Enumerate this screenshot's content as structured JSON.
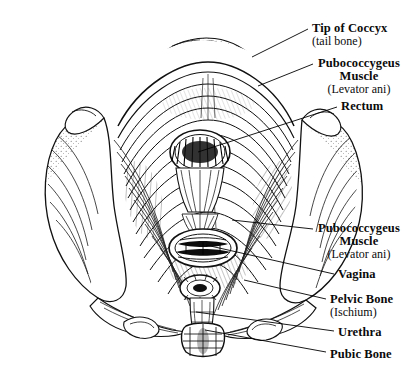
{
  "figure": {
    "style": "pen-and-ink engraving, black line art on white",
    "background_color": "#ffffff",
    "ink_color": "#000000"
  },
  "labels": [
    {
      "id": "tip-of-coccyx",
      "primary": "Tip of Coccyx",
      "secondary": "(tail bone)",
      "align": "left",
      "text_x": 312,
      "text_y": 22,
      "leader": {
        "x1": 308,
        "y1": 29,
        "x2": 252,
        "y2": 57
      }
    },
    {
      "id": "pubococcygeus-muscle-upper",
      "primary": "Pubococcygeus",
      "primary2": "Muscle",
      "secondary": "(Levator ani)",
      "align": "center",
      "text_x": 318,
      "text_y": 57,
      "leader": {
        "x1": 313,
        "y1": 64,
        "x2": 258,
        "y2": 86
      }
    },
    {
      "id": "rectum",
      "primary": "Rectum",
      "align": "left",
      "text_x": 341,
      "text_y": 100,
      "leader": {
        "x1": 337,
        "y1": 107,
        "x2": 198,
        "y2": 152
      }
    },
    {
      "id": "pubococcygeus-muscle-lower",
      "primary": "Pubococcygeus",
      "primary2": "Muscle",
      "secondary": "(Levator ani)",
      "align": "center",
      "text_x": 318,
      "text_y": 222,
      "leader": {
        "x1": 313,
        "y1": 229,
        "x2": 232,
        "y2": 220
      }
    },
    {
      "id": "vagina",
      "primary": "Vagina",
      "align": "left",
      "text_x": 338,
      "text_y": 268,
      "leader": {
        "x1": 334,
        "y1": 274,
        "x2": 206,
        "y2": 245
      }
    },
    {
      "id": "pelvic-bone",
      "primary": "Pelvic Bone",
      "secondary": "(Ischium)",
      "align": "left",
      "text_x": 330,
      "text_y": 293,
      "leader": {
        "x1": 326,
        "y1": 299,
        "x2": 244,
        "y2": 280
      }
    },
    {
      "id": "urethra",
      "primary": "Urethra",
      "align": "left",
      "text_x": 338,
      "text_y": 326,
      "leader": {
        "x1": 334,
        "y1": 331,
        "x2": 196,
        "y2": 312
      }
    },
    {
      "id": "pubic-bone",
      "primary": "Pubic Bone",
      "align": "left",
      "text_x": 330,
      "text_y": 348,
      "leader": {
        "x1": 326,
        "y1": 352,
        "x2": 205,
        "y2": 330
      }
    }
  ]
}
